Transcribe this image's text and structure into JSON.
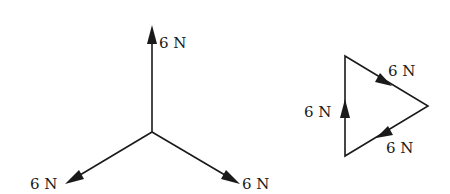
{
  "diagram": {
    "type": "force-diagram",
    "colors": {
      "ink": "#1a1a1a",
      "background": "#ffffff"
    },
    "concurrent_forces": {
      "origin": [
        152,
        132
      ],
      "forces": [
        {
          "id": "up",
          "label": "6 N",
          "tip": [
            152,
            25
          ],
          "label_pos": [
            159,
            48
          ]
        },
        {
          "id": "down-left",
          "label": "6 N",
          "tip": [
            65,
            184
          ],
          "label_pos": [
            30,
            189
          ]
        },
        {
          "id": "down-right",
          "label": "6 N",
          "tip": [
            240,
            184
          ],
          "label_pos": [
            242,
            189
          ]
        }
      ]
    },
    "triangle_of_forces": {
      "vertices": {
        "top": [
          345,
          56
        ],
        "right": [
          428,
          106
        ],
        "bottom": [
          345,
          156
        ]
      },
      "sides": [
        {
          "id": "top-side",
          "label": "6 N",
          "label_pos": [
            388,
            76
          ]
        },
        {
          "id": "lower-side",
          "label": "6 N",
          "label_pos": [
            386,
            153
          ]
        },
        {
          "id": "left-side",
          "label": "6 N",
          "label_pos": [
            304,
            117
          ]
        }
      ]
    }
  }
}
